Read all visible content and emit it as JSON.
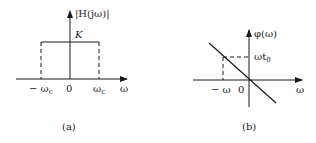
{
  "figure_a": {
    "caption": "(a)",
    "y_label": "|H(jω)|",
    "level_label": "K",
    "x_ticks": {
      "neg_cutoff": "− ω",
      "neg_cutoff_sub": "c",
      "origin": "0",
      "pos_cutoff": "ω",
      "pos_cutoff_sub": "c"
    },
    "x_label": "ω"
  },
  "figure_b": {
    "caption": "(b)",
    "y_label": "φ(ω)",
    "level_label": "ωt",
    "level_label_sub": "0",
    "x_ticks": {
      "neg_omega": "− ω",
      "origin": "0"
    },
    "x_label": "ω"
  },
  "colors": {
    "ink": "#1a1a1a",
    "background": "#ffffff"
  }
}
